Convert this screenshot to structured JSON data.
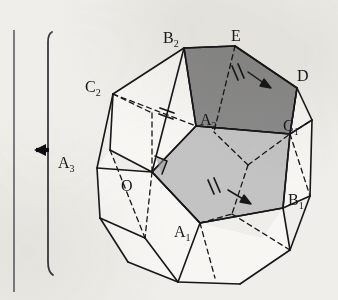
{
  "figure": {
    "kind": "geometry-diagram",
    "background_color": "#efeeea",
    "ink_color": "#17171a"
  },
  "margin": {
    "page_rule_name": "page-margin-rule",
    "bracket_name": "section-bracket",
    "arrow_name": "left-pointing-arrow",
    "arrow_glyph": "←"
  },
  "shading": {
    "dark_face_color": "#8a8a8a",
    "light_face_color": "#c3c3c3",
    "white_face_color": "#f7f6f3"
  },
  "vertices": [
    {
      "id": "B2",
      "label": "B",
      "sub": "2",
      "x": 163,
      "y": 30,
      "px": 184,
      "py": 48
    },
    {
      "id": "E",
      "label": "E",
      "sub": "",
      "x": 231,
      "y": 28,
      "px": 235,
      "py": 46
    },
    {
      "id": "D",
      "label": "D",
      "sub": "",
      "x": 297,
      "y": 68,
      "px": 297,
      "py": 88
    },
    {
      "id": "C2",
      "label": "C",
      "sub": "2",
      "x": 85,
      "y": 79,
      "px": 113,
      "py": 94
    },
    {
      "id": "A2",
      "label": "A",
      "sub": "2",
      "x": 200,
      "y": 112,
      "px": 196,
      "py": 126
    },
    {
      "id": "C1",
      "label": "C",
      "sub": "1",
      "x": 283,
      "y": 118,
      "px": 290,
      "py": 134
    },
    {
      "id": "A3",
      "label": "A",
      "sub": "3",
      "x": 58,
      "y": 155,
      "px": 97,
      "py": 168
    },
    {
      "id": "O",
      "label": "O",
      "sub": "",
      "x": 121,
      "y": 178,
      "px": 152,
      "py": 172
    },
    {
      "id": "A1",
      "label": "A",
      "sub": "1",
      "x": 174,
      "y": 224,
      "px": 200,
      "py": 223
    },
    {
      "id": "B1",
      "label": "B",
      "sub": "1",
      "x": 288,
      "y": 192,
      "px": 283,
      "py": 208
    }
  ],
  "markers": {
    "tick_count": 2,
    "right_angle_name": "right-angle-marker-at-O",
    "edge_ticks": [
      {
        "name": "tick-mark-on-edge-B2E-D",
        "position": "upper-right-face"
      },
      {
        "name": "tick-mark-on-edge-C2-A2",
        "position": "upper-left-edge"
      },
      {
        "name": "tick-mark-on-edge-O-B1",
        "position": "lower-centre-edge"
      }
    ],
    "direction_arrows": [
      {
        "name": "direction-arrow-upper-face",
        "position": "upper-right-face"
      },
      {
        "name": "direction-arrow-lower-face",
        "position": "centre-face"
      }
    ]
  },
  "strokes": {
    "solid_edge_width": 1.6,
    "hidden_edge_width": 1.3,
    "hidden_edge_dash": "5 4"
  }
}
